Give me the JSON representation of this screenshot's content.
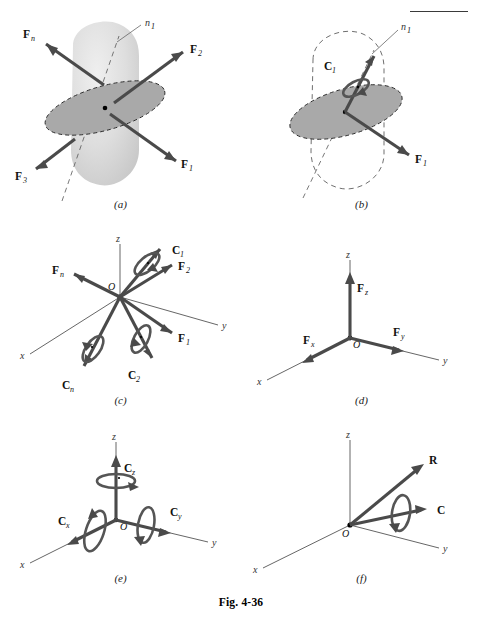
{
  "figure": {
    "caption": "Fig. 4-36",
    "panel_labels": [
      "(a)",
      "(b)",
      "(c)",
      "(d)",
      "(e)",
      "(f)"
    ]
  },
  "panels": {
    "a": {
      "label": "(a)",
      "description": "rigid body with system of forces acting about axis n1",
      "axis_label": "n",
      "axis_sub": "1",
      "vectors": [
        {
          "name": "F",
          "sub": "n"
        },
        {
          "name": "F",
          "sub": "2"
        },
        {
          "name": "F",
          "sub": "1"
        },
        {
          "name": "F",
          "sub": "3"
        }
      ]
    },
    "b": {
      "label": "(b)",
      "description": "resultant force and couple on the n1 plane",
      "axis_label": "n",
      "axis_sub": "1",
      "vectors": [
        {
          "name": "C",
          "sub": "1"
        },
        {
          "name": "F",
          "sub": "1"
        }
      ]
    },
    "c": {
      "label": "(c)",
      "description": "forces and couples at origin O in xyz coordinates",
      "origin": "O",
      "axes": [
        "x",
        "y",
        "z"
      ],
      "vectors": [
        {
          "name": "F",
          "sub": "n"
        },
        {
          "name": "F",
          "sub": "2"
        },
        {
          "name": "F",
          "sub": "1"
        },
        {
          "name": "C",
          "sub": "1"
        },
        {
          "name": "C",
          "sub": "2"
        },
        {
          "name": "C",
          "sub": "n"
        }
      ]
    },
    "d": {
      "label": "(d)",
      "description": "rectangular components of resultant force",
      "origin": "O",
      "axes": [
        "x",
        "y",
        "z"
      ],
      "vectors": [
        {
          "name": "F",
          "sub": "x"
        },
        {
          "name": "F",
          "sub": "y"
        },
        {
          "name": "F",
          "sub": "z"
        }
      ]
    },
    "e": {
      "label": "(e)",
      "description": "rectangular components of resultant couple",
      "origin": "O",
      "axes": [
        "x",
        "y",
        "z"
      ],
      "vectors": [
        {
          "name": "C",
          "sub": "x"
        },
        {
          "name": "C",
          "sub": "y"
        },
        {
          "name": "C",
          "sub": "z"
        }
      ]
    },
    "f": {
      "label": "(f)",
      "description": "resultant force R and resultant couple C",
      "origin": "O",
      "axes": [
        "x",
        "y",
        "z"
      ],
      "vectors": [
        {
          "name": "R",
          "sub": ""
        },
        {
          "name": "C",
          "sub": ""
        }
      ]
    }
  },
  "colors": {
    "vector": "#4a4a4a",
    "axis": "#555555",
    "blob": "#d9d9d9",
    "ellipse": "#a9a9a9",
    "text": "#111111",
    "background": "#ffffff"
  }
}
